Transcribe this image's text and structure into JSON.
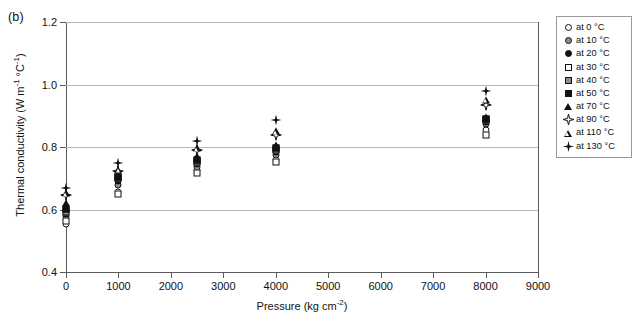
{
  "panel": {
    "label": "(b)"
  },
  "chart_data": {
    "type": "scatter",
    "title": "",
    "xlabel": "Pressure (kg cm⁻²)",
    "ylabel": "Thermal conductivity (W m⁻¹ °C⁻¹)",
    "xlim": [
      0,
      9000
    ],
    "ylim": [
      0.4,
      1.2
    ],
    "xticks": [
      0,
      1000,
      2000,
      3000,
      4000,
      5000,
      6000,
      7000,
      8000,
      9000
    ],
    "xticklabels": [
      "0",
      "1000",
      "2000",
      "3000",
      "4000",
      "5000",
      "6000",
      "7000",
      "8000",
      "9000"
    ],
    "yticks": [
      0.4,
      0.6,
      0.8,
      1.0,
      1.2
    ],
    "yticklabels": [
      "0.4",
      "0.6",
      "0.8",
      "1.0",
      "1.2"
    ],
    "grid": "horizontal",
    "legend_position": "right-outside",
    "x": [
      0,
      1000,
      2500,
      4000,
      8000
    ],
    "series": [
      {
        "name": "at 0 °C",
        "marker": "open-circle",
        "values": [
          0.555,
          0.655,
          0.725,
          0.76,
          0.855
        ]
      },
      {
        "name": "at 10 °C",
        "marker": "gray-circle",
        "values": [
          0.57,
          0.68,
          0.735,
          0.775,
          0.875
        ]
      },
      {
        "name": "at 20 °C",
        "marker": "fill-circle",
        "values": [
          0.58,
          0.69,
          0.745,
          0.785,
          0.88
        ]
      },
      {
        "name": "at 30 °C",
        "marker": "open-square",
        "values": [
          0.562,
          0.65,
          0.718,
          0.752,
          0.84
        ]
      },
      {
        "name": "at 40 °C",
        "marker": "gray-square",
        "values": [
          0.592,
          0.7,
          0.752,
          0.79,
          0.885
        ]
      },
      {
        "name": "at 50 °C",
        "marker": "fill-square",
        "values": [
          0.602,
          0.705,
          0.76,
          0.796,
          0.89
        ]
      },
      {
        "name": "at 70 °C",
        "marker": "fill-triangle",
        "values": [
          0.622,
          0.712,
          0.772,
          0.805,
          0.895
        ]
      },
      {
        "name": "at 90 °C",
        "marker": "star4",
        "values": [
          0.645,
          0.722,
          0.79,
          0.84,
          0.935
        ]
      },
      {
        "name": "at 110 °C",
        "marker": "open-triangle",
        "values": [
          0.652,
          0.728,
          0.796,
          0.85,
          0.95
        ]
      },
      {
        "name": "at 130 °C",
        "marker": "plus4",
        "values": [
          0.668,
          0.748,
          0.82,
          0.885,
          0.98
        ]
      }
    ]
  },
  "legend": {
    "items": [
      {
        "label": "at 0 °C",
        "marker": "open-circle"
      },
      {
        "label": "at 10 °C",
        "marker": "gray-circle"
      },
      {
        "label": "at 20 °C",
        "marker": "fill-circle"
      },
      {
        "label": "at 30 °C",
        "marker": "open-square"
      },
      {
        "label": "at 40 °C",
        "marker": "gray-square"
      },
      {
        "label": "at 50 °C",
        "marker": "fill-square"
      },
      {
        "label": "at 70 °C",
        "marker": "fill-triangle"
      },
      {
        "label": "at 90 °C",
        "marker": "star4"
      },
      {
        "label": "at 110 °C",
        "marker": "open-triangle"
      },
      {
        "label": "at 130 °C",
        "marker": "plus4"
      }
    ]
  },
  "colors": {
    "marker_fill": "#111111",
    "marker_gray": "#8c8c8c",
    "grid": "#b9b9b9",
    "axis": "#5a5a5a",
    "background": "#ffffff"
  }
}
